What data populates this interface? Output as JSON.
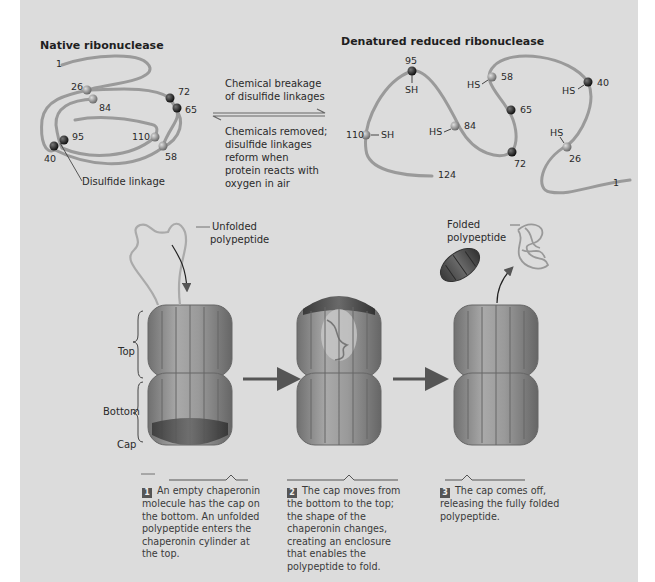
{
  "top": {
    "native": {
      "title": "Native ribonuclease",
      "residues": [
        "1",
        "26",
        "84",
        "72",
        "65",
        "95",
        "110",
        "40",
        "58"
      ],
      "disulfide_label": "Disulfide linkage"
    },
    "arrows": {
      "forward_label_line1": "Chemical breakage",
      "forward_label_line2": "of disulfide linkages",
      "reverse_label_lines": [
        "Chemicals removed;",
        "disulfide linkages",
        "reform when",
        "protein reacts with",
        "oxygen in air"
      ]
    },
    "denatured": {
      "title": "Denatured reduced ribonuclease",
      "residues": [
        "95",
        "58",
        "40",
        "65",
        "84",
        "110",
        "72",
        "26",
        "124",
        "1"
      ],
      "sh_labels": [
        "SH",
        "SH",
        "HS",
        "HS",
        "HS",
        "HS"
      ]
    }
  },
  "bottom": {
    "labels": {
      "unfolded_line1": "Unfolded",
      "unfolded_line2": "polypeptide",
      "folded_line1": "Folded",
      "folded_line2": "polypeptide",
      "top": "Top",
      "bottom": "Bottom",
      "cap": "Cap"
    },
    "steps": [
      {
        "number": "1",
        "text": "An empty chaperonin molecule has the cap on the bottom. An unfolded polypeptide enters the chaperonin cylinder at the top."
      },
      {
        "number": "2",
        "text": "The cap moves from the bottom to the top; the shape of the chaperonin changes, creating an enclosure that enables the polypeptide to fold."
      },
      {
        "number": "3",
        "text": "The cap comes off, releasing the fully folded polypeptide."
      }
    ]
  },
  "colors": {
    "panel": "#dcdcdc",
    "strand": "#9a9a9a",
    "dark_ball": "#222222",
    "light_ball": "#8c8c8c",
    "barrel": "#8e8e8e",
    "cap": "#4a4a4a"
  }
}
